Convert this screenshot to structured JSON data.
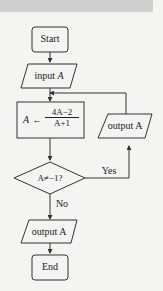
{
  "flowchart": {
    "start": "Start",
    "input": {
      "prefix": "input ",
      "var": "A"
    },
    "assign": {
      "target": "A",
      "arrow": "←",
      "numerator": "4A−2",
      "denominator": "A+1"
    },
    "decision": "A≠−1?",
    "yes_label": "Yes",
    "no_label": "No",
    "loop_output": "output A",
    "final_output": "output A",
    "end": "End"
  },
  "colors": {
    "background": "#f4f4f2",
    "stroke": "#333333",
    "band": "#cfcfcf"
  }
}
